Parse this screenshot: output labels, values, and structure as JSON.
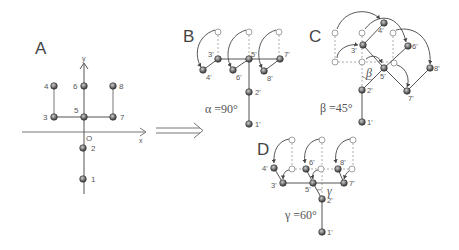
{
  "panels": {
    "A": {
      "label": "A",
      "axis_y_label": "y",
      "axis_x_label": "x",
      "origin_label": "O",
      "nodes": [
        {
          "id": "1",
          "label": "1"
        },
        {
          "id": "2",
          "label": "2"
        },
        {
          "id": "3",
          "label": "3"
        },
        {
          "id": "4",
          "label": "4"
        },
        {
          "id": "5",
          "label": "5"
        },
        {
          "id": "6",
          "label": "6"
        },
        {
          "id": "7",
          "label": "7"
        },
        {
          "id": "8",
          "label": "8"
        }
      ]
    },
    "B": {
      "label": "B",
      "angle_label": "α =90°",
      "nodes": [
        "1'",
        "2'",
        "3'",
        "4'",
        "5'",
        "6'",
        "7'",
        "8'"
      ]
    },
    "C": {
      "label": "C",
      "angle_symbol": "β",
      "angle_label": "β =45°",
      "nodes": [
        "1'",
        "2'",
        "3'",
        "4'",
        "5'",
        "6'",
        "7'",
        "8'"
      ]
    },
    "D": {
      "label": "D",
      "angle_symbol": "γ",
      "angle_label": "γ =60°",
      "nodes": [
        "1'",
        "2'",
        "3'",
        "4'",
        "5'",
        "6'",
        "7'",
        "8'"
      ]
    }
  },
  "arrow": {
    "type": "double-line implies arrow"
  },
  "colors": {
    "line": "#555555",
    "node_fill": "#6a6a6a",
    "hollow_stroke": "#888888",
    "dashed": "#999999"
  }
}
